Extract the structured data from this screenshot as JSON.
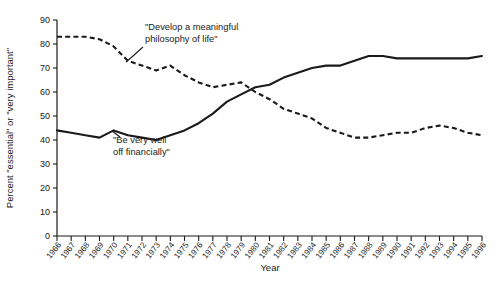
{
  "chart_data": {
    "type": "line",
    "title": "",
    "xlabel": "Year",
    "ylabel": "Percent \"essential\" or \"very important\"",
    "xlim": [
      1966,
      1996
    ],
    "ylim": [
      0,
      90
    ],
    "ytick_step": 10,
    "grid": false,
    "legend": "annotations-on-plot",
    "categories": [
      "1966",
      "1967",
      "1968",
      "1969",
      "1970",
      "1971",
      "1972",
      "1973",
      "1974",
      "1975",
      "1976",
      "1977",
      "1978",
      "1979",
      "1980",
      "1981",
      "1982",
      "1983",
      "1984",
      "1985",
      "1986",
      "1987",
      "1988",
      "1989",
      "1990",
      "1991",
      "1992",
      "1993",
      "1994",
      "1995",
      "1996"
    ],
    "ytick_labels": [
      "0",
      "10",
      "20",
      "30",
      "40",
      "50",
      "60",
      "70",
      "80",
      "90"
    ],
    "series": [
      {
        "name": "Be very well off financially",
        "style": "solid",
        "color": "#1a1a1a",
        "values": [
          44,
          43,
          42,
          41,
          44,
          42,
          41,
          40,
          42,
          44,
          47,
          51,
          56,
          59,
          62,
          63,
          66,
          68,
          70,
          71,
          71,
          73,
          75,
          75,
          74,
          74,
          74,
          74,
          74,
          74,
          75
        ]
      },
      {
        "name": "Develop a meaningful philosophy of life",
        "style": "dashed",
        "color": "#1a1a1a",
        "values": [
          83,
          83,
          83,
          82,
          79,
          73,
          71,
          69,
          71,
          67,
          64,
          62,
          63,
          64,
          60,
          57,
          53,
          51,
          49,
          45,
          43,
          41,
          41,
          42,
          43,
          43,
          45,
          46,
          45,
          43,
          42
        ]
      }
    ],
    "annotations": [
      {
        "id": "annotation-philosophy",
        "lines": [
          "\"Develop a meaningful",
          "philosophy of life\""
        ],
        "x": 145,
        "y": 30
      },
      {
        "id": "annotation-financial",
        "lines": [
          "\"Be very well",
          "off financially\""
        ],
        "x": 113,
        "y": 143
      }
    ]
  }
}
